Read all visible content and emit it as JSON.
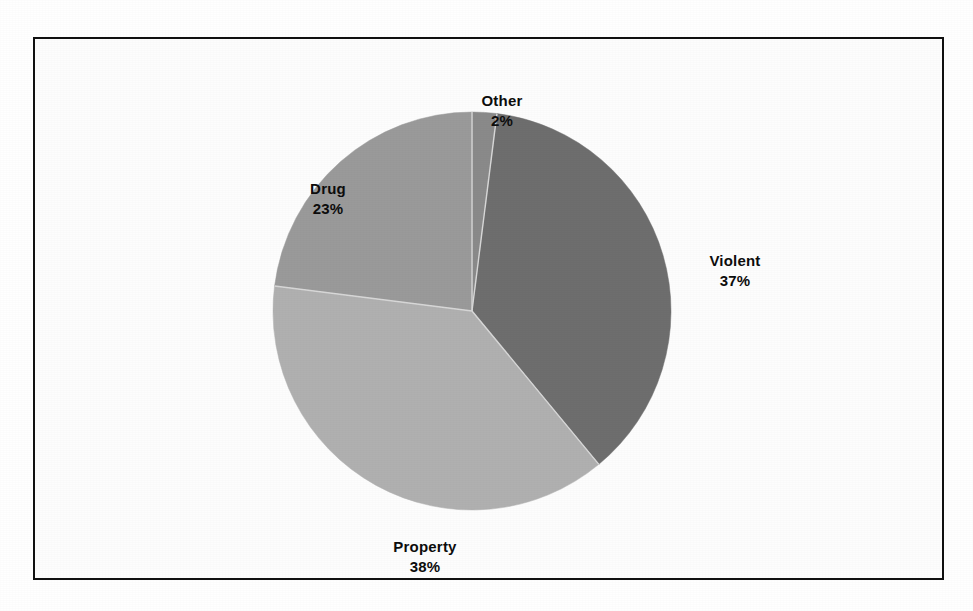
{
  "figure": {
    "background_color": "#ffffff",
    "frame_color": "#111111"
  },
  "chart_data": {
    "type": "pie",
    "title": "",
    "subtitle": "",
    "xlabel": "",
    "ylabel": "",
    "legend_position": "none",
    "labels_position": "outside",
    "grid": false,
    "total_percent": 100,
    "categories": [
      "Violent",
      "Property",
      "Drug",
      "Other"
    ],
    "values": [
      37,
      38,
      23,
      2
    ],
    "value_suffix": "%",
    "slices": [
      {
        "name": "Violent",
        "label": "Violent",
        "value": 37,
        "value_label": "37%",
        "color": "#6e6e6e",
        "start_angle_deg": 7.2,
        "end_angle_deg": 140.4
      },
      {
        "name": "Property",
        "label": "Property",
        "value": 38,
        "value_label": "38%",
        "color": "#b0b0b0",
        "start_angle_deg": 140.4,
        "end_angle_deg": 277.2
      },
      {
        "name": "Drug",
        "label": "Drug",
        "value": 23,
        "value_label": "23%",
        "color": "#9a9a9a",
        "start_angle_deg": 277.2,
        "end_angle_deg": 360.0
      },
      {
        "name": "Other",
        "label": "Other",
        "value": 2,
        "value_label": "2%",
        "color": "#8a8a8a",
        "start_angle_deg": 0.0,
        "end_angle_deg": 7.2
      }
    ]
  }
}
